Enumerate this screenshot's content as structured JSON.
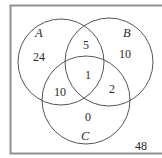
{
  "diagram": {
    "type": "venn-3",
    "universe": {
      "label": "",
      "count_outside": "48",
      "border_color": "#8a8a8a"
    },
    "sets": [
      {
        "name": "A",
        "cx": 61,
        "cy": 62,
        "r": 43
      },
      {
        "name": "B",
        "cx": 109,
        "cy": 62,
        "r": 44
      },
      {
        "name": "C",
        "cx": 86,
        "cy": 100,
        "r": 44
      }
    ],
    "regions": {
      "A_only": "24",
      "B_only": "10",
      "C_only": "0",
      "A_and_B_only": "5",
      "A_and_C_only": "10",
      "B_and_C_only": "2",
      "A_and_B_and_C": "1",
      "none": "48"
    },
    "colors": {
      "stroke": "#555555",
      "text": "#2a2a2a",
      "background": "#ffffff"
    }
  }
}
